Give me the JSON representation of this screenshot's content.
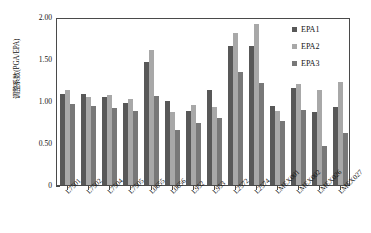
{
  "chart_data": {
    "type": "bar",
    "title": "",
    "subtitle": "",
    "xlabel": "",
    "ylabel": "调整系数(PGA/EPA)",
    "ylim": [
      0,
      2.0
    ],
    "ytick_labels": [
      "0",
      "0.50",
      "1.00",
      "1.50",
      "2.00"
    ],
    "ytick_values": [
      0,
      0.5,
      1.0,
      1.5,
      2.0
    ],
    "grid": false,
    "legend_position": "top-right",
    "categories": [
      "L7501",
      "L7502",
      "L7504",
      "L7505",
      "L0655",
      "L0656",
      "L952",
      "L953",
      "L2572",
      "L2574",
      "LMEX001",
      "LMEX002",
      "LMEX026",
      "LMEX027"
    ],
    "series": [
      {
        "name": "EPA1",
        "color": "#585858",
        "values": [
          1.08,
          1.08,
          1.05,
          0.98,
          1.46,
          1.0,
          0.88,
          1.13,
          1.66,
          1.66,
          0.94,
          1.15,
          0.87,
          0.93
        ]
      },
      {
        "name": "EPA2",
        "color": "#a8a8a8",
        "values": [
          1.13,
          1.05,
          1.07,
          1.02,
          1.61,
          0.87,
          0.95,
          0.93,
          1.81,
          1.92,
          0.88,
          1.2,
          1.13,
          1.23
        ]
      },
      {
        "name": "EPA3",
        "color": "#787878",
        "values": [
          0.96,
          0.94,
          0.92,
          0.88,
          1.06,
          0.66,
          0.74,
          0.8,
          1.35,
          1.21,
          0.76,
          0.89,
          0.47,
          0.62
        ]
      }
    ]
  },
  "axes": {
    "frame_color": "#4a4a4a"
  }
}
